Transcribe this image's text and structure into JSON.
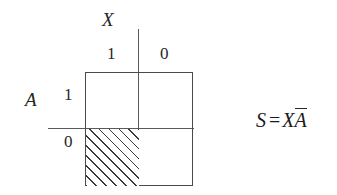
{
  "diagram": {
    "type": "karnaugh-veitch-map",
    "variables": {
      "column_variable": "X",
      "row_variable": "A"
    },
    "column_headers": [
      "1",
      "0"
    ],
    "row_headers": [
      "1",
      "0"
    ],
    "cells": [
      {
        "column": "1",
        "row": "1",
        "shaded": false
      },
      {
        "column": "0",
        "row": "1",
        "shaded": false
      },
      {
        "column": "1",
        "row": "0",
        "shaded": true
      },
      {
        "column": "0",
        "row": "0",
        "shaded": false
      }
    ],
    "shading": {
      "style": "diagonal-hatch",
      "angle_degrees": 45,
      "color": "#3a3a3a",
      "spacing_px": 7
    },
    "colors": {
      "background": "#ffffff",
      "ink": "#262626",
      "rule": "#4a4a4a",
      "axis": "#5a5a5a"
    }
  },
  "equation": {
    "lhs": "S",
    "operator": "=",
    "term_plain": "X",
    "term_complement": "A",
    "full_text": "S = XĀ"
  }
}
